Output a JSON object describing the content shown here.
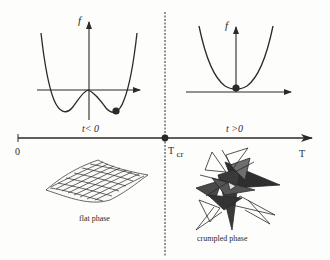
{
  "diagram": {
    "type": "phase-transition-schematic",
    "colors": {
      "ink": "#2a2a2a",
      "background": "#fdfdfb",
      "dark_fill": "#3a3a3a",
      "mid_fill": "#7a7a7a"
    },
    "left_plot": {
      "y_axis_label": "f",
      "condition_label": "t< 0",
      "curve": "double-well potential",
      "ball": "in right well"
    },
    "right_plot": {
      "y_axis_label": "f",
      "condition_label": "t >0",
      "curve": "single-well parabola",
      "ball": "at minimum"
    },
    "temperature_axis": {
      "origin_label": "0",
      "critical_label": "T",
      "critical_subscript": "cr",
      "axis_label": "T"
    },
    "phases": {
      "left_label": "flat phase",
      "right_label": "crumpled phase"
    }
  }
}
